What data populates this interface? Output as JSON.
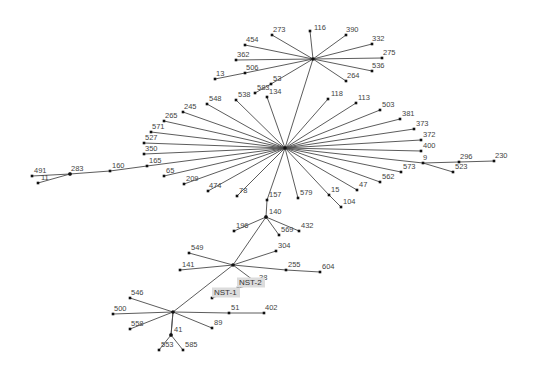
{
  "diagram": {
    "type": "minimum-spanning-tree",
    "hubs": [
      {
        "id": "hub-top",
        "x": 313,
        "y": 59
      },
      {
        "id": "hub-center",
        "x": 285,
        "y": 148
      },
      {
        "id": "hub-140",
        "x": 266,
        "y": 217
      },
      {
        "id": "hub-mid",
        "x": 233,
        "y": 265
      },
      {
        "id": "hub-bottom",
        "x": 173,
        "y": 312
      },
      {
        "id": "hub-41",
        "x": 171,
        "y": 335
      },
      {
        "id": "hub-283",
        "x": 70,
        "y": 174
      }
    ],
    "nodes": [
      {
        "label": "116",
        "x": 310,
        "y": 31,
        "lx": 313,
        "ly": 30,
        "parent": "hub-top"
      },
      {
        "label": "273",
        "x": 272,
        "y": 35,
        "lx": 272,
        "ly": 32,
        "parent": "hub-top"
      },
      {
        "label": "390",
        "x": 346,
        "y": 35,
        "lx": 345,
        "ly": 32,
        "parent": "hub-top"
      },
      {
        "label": "454",
        "x": 245,
        "y": 45,
        "lx": 245,
        "ly": 42,
        "parent": "hub-top"
      },
      {
        "label": "332",
        "x": 372,
        "y": 44,
        "lx": 371,
        "ly": 41,
        "parent": "hub-top"
      },
      {
        "label": "362",
        "x": 236,
        "y": 60,
        "lx": 236,
        "ly": 57,
        "parent": "hub-top"
      },
      {
        "label": "275",
        "x": 382,
        "y": 58,
        "lx": 382,
        "ly": 55,
        "parent": "hub-top"
      },
      {
        "label": "536",
        "x": 372,
        "y": 71,
        "lx": 371,
        "ly": 68,
        "parent": "hub-top"
      },
      {
        "label": "506",
        "x": 245,
        "y": 73,
        "lx": 245,
        "ly": 70,
        "parent": "hub-top"
      },
      {
        "label": "13",
        "x": 215,
        "y": 79,
        "lx": 215,
        "ly": 76,
        "parent": "506"
      },
      {
        "label": "264",
        "x": 346,
        "y": 81,
        "lx": 346,
        "ly": 78,
        "parent": "hub-top"
      },
      {
        "label": "53",
        "x": 271,
        "y": 84,
        "lx": 272,
        "ly": 81,
        "parent": "hub-top"
      },
      {
        "label": "583",
        "x": 255,
        "y": 93,
        "lx": 256,
        "ly": 90,
        "parent": "53"
      },
      {
        "label": "134",
        "x": 267,
        "y": 97,
        "lx": 268,
        "ly": 94,
        "parent": "hub-center"
      },
      {
        "label": "538",
        "x": 236,
        "y": 100,
        "lx": 237,
        "ly": 97,
        "parent": "hub-center"
      },
      {
        "label": "548",
        "x": 207,
        "y": 104,
        "lx": 208,
        "ly": 101,
        "parent": "hub-center"
      },
      {
        "label": "118",
        "x": 328,
        "y": 99,
        "lx": 330,
        "ly": 96,
        "parent": "hub-center"
      },
      {
        "label": "113",
        "x": 356,
        "y": 103,
        "lx": 357,
        "ly": 100,
        "parent": "hub-center"
      },
      {
        "label": "503",
        "x": 380,
        "y": 110,
        "lx": 381,
        "ly": 107,
        "parent": "hub-center"
      },
      {
        "label": "381",
        "x": 400,
        "y": 119,
        "lx": 401,
        "ly": 116,
        "parent": "hub-center"
      },
      {
        "label": "373",
        "x": 414,
        "y": 129,
        "lx": 415,
        "ly": 126,
        "parent": "hub-center"
      },
      {
        "label": "372",
        "x": 421,
        "y": 140,
        "lx": 422,
        "ly": 137,
        "parent": "hub-center"
      },
      {
        "label": "400",
        "x": 421,
        "y": 151,
        "lx": 422,
        "ly": 148,
        "parent": "hub-center"
      },
      {
        "label": "245",
        "x": 183,
        "y": 112,
        "lx": 183,
        "ly": 109,
        "parent": "hub-center"
      },
      {
        "label": "265",
        "x": 164,
        "y": 121,
        "lx": 164,
        "ly": 118,
        "parent": "hub-center"
      },
      {
        "label": "571",
        "x": 151,
        "y": 132,
        "lx": 151,
        "ly": 129,
        "parent": "hub-center"
      },
      {
        "label": "527",
        "x": 144,
        "y": 143,
        "lx": 144,
        "ly": 140,
        "parent": "hub-center"
      },
      {
        "label": "350",
        "x": 144,
        "y": 154,
        "lx": 144,
        "ly": 151,
        "parent": "hub-center"
      },
      {
        "label": "165",
        "x": 147,
        "y": 166,
        "lx": 148,
        "ly": 163,
        "parent": "hub-center"
      },
      {
        "label": "160",
        "x": 110,
        "y": 171,
        "lx": 111,
        "ly": 168,
        "parent": "165"
      },
      {
        "label": "283",
        "x": 70,
        "y": 174,
        "lx": 70,
        "ly": 171,
        "parent": "160"
      },
      {
        "label": "491",
        "x": 32,
        "y": 176,
        "lx": 33,
        "ly": 173,
        "parent": "283"
      },
      {
        "label": "11",
        "x": 38,
        "y": 183,
        "lx": 40,
        "ly": 180,
        "parent": "283"
      },
      {
        "label": "65",
        "x": 164,
        "y": 176,
        "lx": 165,
        "ly": 173,
        "parent": "hub-center"
      },
      {
        "label": "209",
        "x": 184,
        "y": 184,
        "lx": 185,
        "ly": 181,
        "parent": "hub-center"
      },
      {
        "label": "474",
        "x": 208,
        "y": 191,
        "lx": 208,
        "ly": 188,
        "parent": "hub-center"
      },
      {
        "label": "78",
        "x": 237,
        "y": 196,
        "lx": 238,
        "ly": 193,
        "parent": "hub-center"
      },
      {
        "label": "157",
        "x": 267,
        "y": 200,
        "lx": 268,
        "ly": 197,
        "parent": "hub-center"
      },
      {
        "label": "579",
        "x": 298,
        "y": 198,
        "lx": 299,
        "ly": 195,
        "parent": "hub-center"
      },
      {
        "label": "15",
        "x": 329,
        "y": 195,
        "lx": 330,
        "ly": 192,
        "parent": "hub-center"
      },
      {
        "label": "104",
        "x": 341,
        "y": 207,
        "lx": 342,
        "ly": 204,
        "parent": "15"
      },
      {
        "label": "47",
        "x": 357,
        "y": 190,
        "lx": 358,
        "ly": 187,
        "parent": "hub-center"
      },
      {
        "label": "562",
        "x": 380,
        "y": 182,
        "lx": 381,
        "ly": 179,
        "parent": "hub-center"
      },
      {
        "label": "573",
        "x": 401,
        "y": 172,
        "lx": 402,
        "ly": 169,
        "parent": "hub-center"
      },
      {
        "label": "9",
        "x": 423,
        "y": 163,
        "lx": 422,
        "ly": 160,
        "parent": "hub-center"
      },
      {
        "label": "296",
        "x": 459,
        "y": 162,
        "lx": 459,
        "ly": 159,
        "parent": "9"
      },
      {
        "label": "523",
        "x": 453,
        "y": 172,
        "lx": 454,
        "ly": 169,
        "parent": "9"
      },
      {
        "label": "230",
        "x": 494,
        "y": 161,
        "lx": 494,
        "ly": 158,
        "parent": "296"
      },
      {
        "label": "140",
        "x": 266,
        "y": 217,
        "lx": 268,
        "ly": 214,
        "parent": "157"
      },
      {
        "label": "196",
        "x": 234,
        "y": 231,
        "lx": 235,
        "ly": 228,
        "parent": "140"
      },
      {
        "label": "569",
        "x": 279,
        "y": 235,
        "lx": 280,
        "ly": 232,
        "parent": "140"
      },
      {
        "label": "432",
        "x": 299,
        "y": 231,
        "lx": 300,
        "ly": 228,
        "parent": "140"
      },
      {
        "label": "549",
        "x": 189,
        "y": 253,
        "lx": 190,
        "ly": 250,
        "parent": "hub-mid"
      },
      {
        "label": "304",
        "x": 276,
        "y": 251,
        "lx": 277,
        "ly": 248,
        "parent": "hub-mid"
      },
      {
        "label": "141",
        "x": 180,
        "y": 270,
        "lx": 181,
        "ly": 267,
        "parent": "hub-mid"
      },
      {
        "label": "255",
        "x": 286,
        "y": 270,
        "lx": 287,
        "ly": 267,
        "parent": "hub-mid"
      },
      {
        "label": "604",
        "x": 320,
        "y": 272,
        "lx": 321,
        "ly": 269,
        "parent": "255"
      },
      {
        "label": "38",
        "x": 257,
        "y": 283,
        "lx": 258,
        "ly": 280,
        "parent": "hub-mid"
      },
      {
        "label": "NST-2",
        "x": 238,
        "y": 288,
        "lx": 238,
        "ly": 285,
        "parent": "38",
        "highlight": true
      },
      {
        "label": "NST-1",
        "x": 212,
        "y": 298,
        "lx": 213,
        "ly": 295,
        "parent": "NST-2",
        "highlight": true
      },
      {
        "label": "546",
        "x": 130,
        "y": 298,
        "lx": 130,
        "ly": 295,
        "parent": "hub-bottom"
      },
      {
        "label": "500",
        "x": 113,
        "y": 314,
        "lx": 113,
        "ly": 311,
        "parent": "hub-bottom"
      },
      {
        "label": "51",
        "x": 229,
        "y": 313,
        "lx": 230,
        "ly": 310,
        "parent": "hub-bottom"
      },
      {
        "label": "402",
        "x": 264,
        "y": 313,
        "lx": 264,
        "ly": 310,
        "parent": "51"
      },
      {
        "label": "558",
        "x": 130,
        "y": 329,
        "lx": 130,
        "ly": 326,
        "parent": "hub-bottom"
      },
      {
        "label": "89",
        "x": 212,
        "y": 328,
        "lx": 213,
        "ly": 325,
        "parent": "hub-bottom"
      },
      {
        "label": "41",
        "x": 171,
        "y": 335,
        "lx": 173,
        "ly": 332,
        "parent": "hub-bottom"
      },
      {
        "label": "553",
        "x": 159,
        "y": 350,
        "lx": 160,
        "ly": 347,
        "parent": "41"
      },
      {
        "label": "585",
        "x": 183,
        "y": 350,
        "lx": 184,
        "ly": 347,
        "parent": "41"
      }
    ],
    "extra_edges": [
      {
        "from": "hub-top",
        "to": "hub-center"
      },
      {
        "from": "hub-140",
        "to": "hub-mid"
      },
      {
        "from": "hub-mid",
        "to": "hub-bottom"
      },
      {
        "from": "hub-bottom",
        "to": "hub-41"
      }
    ],
    "colors": {
      "edge": "#4a4a4a",
      "node": "#111111",
      "label": "#444444",
      "highlight_bg": "#dcdcdc"
    }
  }
}
